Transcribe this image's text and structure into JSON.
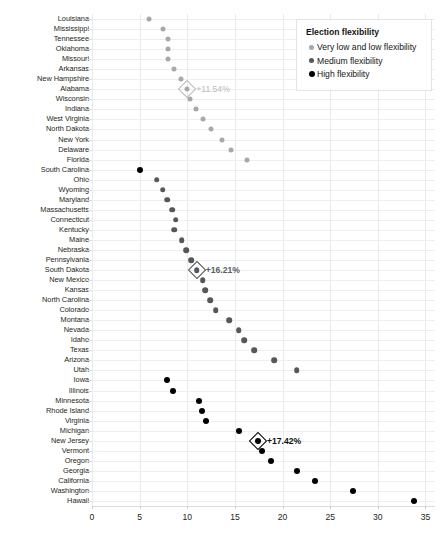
{
  "chart_data": {
    "type": "scatter",
    "title": "",
    "xlabel": "",
    "ylabel": "",
    "xlim": [
      0,
      36
    ],
    "ylim": null,
    "grid": true,
    "orientation": "horizontal-dot-plot",
    "xticks": [
      0,
      5,
      10,
      15,
      20,
      25,
      30,
      35
    ],
    "categories": [
      "Louisiana",
      "Mississippi",
      "Tennessee",
      "Oklahoma",
      "Missouri",
      "Arkansas",
      "New Hampshire",
      "Alabama",
      "Wisconsin",
      "Indiana",
      "West Virginia",
      "North Dakota",
      "New York",
      "Delaware",
      "Florida",
      "South Carolina",
      "Ohio",
      "Wyoming",
      "Maryland",
      "Massachusetts",
      "Connecticut",
      "Kentucky",
      "Maine",
      "Nebraska",
      "Pennsylvania",
      "South Dakota",
      "New Mexico",
      "Kansas",
      "North Carolina",
      "Colorado",
      "Montana",
      "Nevada",
      "Idaho",
      "Texas",
      "Arizona",
      "Utah",
      "Iowa",
      "Illinois",
      "Minnesota",
      "Rhode Island",
      "Virginia",
      "Michigan",
      "New Jersey",
      "Vermont",
      "Oregon",
      "Georgia",
      "California",
      "Washington",
      "Hawaii"
    ],
    "values": [
      6.0,
      7.5,
      8.0,
      8.0,
      8.0,
      8.6,
      9.3,
      11.54,
      10.3,
      10.9,
      11.7,
      12.5,
      13.6,
      14.6,
      16.3,
      5.0,
      6.8,
      7.4,
      7.9,
      8.4,
      8.2,
      8.2,
      8.9,
      9.4,
      9.8,
      10.4,
      10.9,
      11.2,
      11.6,
      12.2,
      13.5,
      14.4,
      14.9,
      16.0,
      16.6,
      18.3,
      20.2,
      22.9,
      24.1,
      25.5,
      26.1,
      29.9,
      32.1,
      7.9,
      8.6,
      11.2,
      11.5,
      12.0,
      15.4
    ],
    "series": [
      {
        "name": "Very low and low flexibility",
        "color": "#a6a8ab",
        "points": [
          {
            "category": "Louisiana",
            "value": 6.0
          },
          {
            "category": "Mississippi",
            "value": 7.5
          },
          {
            "category": "Tennessee",
            "value": 8.0
          },
          {
            "category": "Oklahoma",
            "value": 8.0
          },
          {
            "category": "Missouri",
            "value": 8.0
          },
          {
            "category": "Arkansas",
            "value": 8.6
          },
          {
            "category": "New Hampshire",
            "value": 9.3
          },
          {
            "category": "Alabama",
            "value": 10.0
          },
          {
            "category": "Wisconsin",
            "value": 10.3
          },
          {
            "category": "Indiana",
            "value": 10.9
          },
          {
            "category": "West Virginia",
            "value": 11.7
          },
          {
            "category": "North Dakota",
            "value": 12.5
          },
          {
            "category": "New York",
            "value": 13.6
          },
          {
            "category": "Delaware",
            "value": 14.6
          },
          {
            "category": "Florida",
            "value": 16.3
          }
        ]
      },
      {
        "name": "Medium flexibility",
        "color": "#55585b",
        "points": [
          {
            "category": "Ohio",
            "value": 6.8
          },
          {
            "category": "Wyoming",
            "value": 7.4
          },
          {
            "category": "Maryland",
            "value": 7.9
          },
          {
            "category": "Massachusetts",
            "value": 8.4
          },
          {
            "category": "Connecticut",
            "value": 8.8
          },
          {
            "category": "Kentucky",
            "value": 8.6
          },
          {
            "category": "Maine",
            "value": 9.4
          },
          {
            "category": "Nebraska",
            "value": 9.9
          },
          {
            "category": "Pennsylvania",
            "value": 10.4
          },
          {
            "category": "South Dakota",
            "value": 11.0
          },
          {
            "category": "New Mexico",
            "value": 11.6
          },
          {
            "category": "Kansas",
            "value": 11.9
          },
          {
            "category": "North Carolina",
            "value": 12.4
          },
          {
            "category": "Colorado",
            "value": 13.0
          },
          {
            "category": "Montana",
            "value": 14.4
          },
          {
            "category": "Nevada",
            "value": 15.4
          },
          {
            "category": "Idaho",
            "value": 16.0
          },
          {
            "category": "Texas",
            "value": 17.0
          },
          {
            "category": "Arizona",
            "value": 19.1
          },
          {
            "category": "Utah",
            "value": 21.5
          }
        ]
      },
      {
        "name": "High flexibility",
        "color": "#010101",
        "points": [
          {
            "category": "South Carolina",
            "value": 5.0
          },
          {
            "category": "Iowa",
            "value": 7.9
          },
          {
            "category": "Illinois",
            "value": 8.5
          },
          {
            "category": "Minnesota",
            "value": 11.2
          },
          {
            "category": "Rhode Island",
            "value": 11.5
          },
          {
            "category": "Virginia",
            "value": 12.0
          },
          {
            "category": "Michigan",
            "value": 15.4
          },
          {
            "category": "New Jersey",
            "value": 17.42
          },
          {
            "category": "Vermont",
            "value": 17.8
          },
          {
            "category": "Oregon",
            "value": 18.8
          },
          {
            "category": "Georgia",
            "value": 21.5
          },
          {
            "category": "California",
            "value": 23.4
          },
          {
            "category": "Washington",
            "value": 27.4
          },
          {
            "category": "Hawaii",
            "value": 33.8
          }
        ]
      }
    ],
    "annotations": [
      {
        "category": "Alabama",
        "value": 10.0,
        "label": "+11.54%",
        "tone": "verylow"
      },
      {
        "category": "South Dakota",
        "value": 11.0,
        "label": "+16.21%",
        "tone": "medium"
      },
      {
        "category": "New Jersey",
        "value": 17.42,
        "label": "+17.42%",
        "tone": "high"
      }
    ],
    "legend": {
      "position": "top-right",
      "title": "Election flexibility",
      "entries": [
        {
          "label": "Very low and low flexibility",
          "key": "verylow",
          "color": "#a6a8ab"
        },
        {
          "label": "Medium flexibility",
          "key": "medium",
          "color": "#55585b"
        },
        {
          "label": "High flexibility",
          "key": "high",
          "color": "#010101"
        }
      ]
    }
  }
}
